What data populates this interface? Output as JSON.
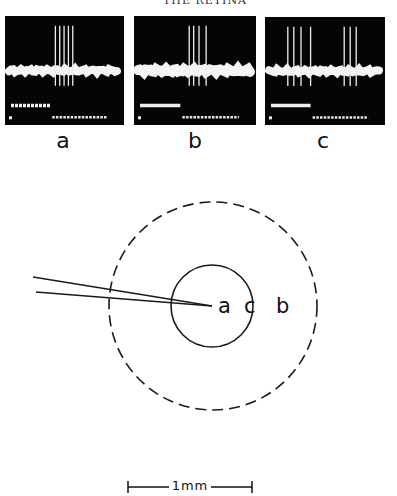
{
  "header": {
    "text": "THE RETINA"
  },
  "panels": [
    {
      "label": "a",
      "spike_groups": [
        [
          58,
          63,
          68,
          73,
          78
        ]
      ],
      "bottom_trace_split": 0.38
    },
    {
      "label": "b",
      "spike_groups": [
        [
          62,
          67,
          73,
          81
        ]
      ],
      "bottom_trace_split": 0.38
    },
    {
      "label": "c",
      "spike_groups": [
        [
          19,
          24,
          30,
          38
        ],
        [
          66,
          71,
          76
        ]
      ],
      "bottom_trace_split": 0.38
    }
  ],
  "diagram": {
    "labels": {
      "a": "a",
      "c": "c",
      "b": "b"
    },
    "outer_circle": {
      "style": "dashed",
      "cx": 213,
      "cy": 156,
      "r": 104
    },
    "inner_circle": {
      "style": "solid",
      "cx": 212,
      "cy": 156,
      "r": 41
    },
    "electrode": {
      "tip": [
        212,
        156
      ],
      "ends": [
        [
          33,
          127
        ],
        [
          36,
          142
        ]
      ]
    }
  },
  "scale_bar": {
    "label": "1mm"
  }
}
